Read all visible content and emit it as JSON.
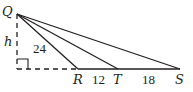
{
  "diagram": {
    "type": "geometry-triangle",
    "points": {
      "Q": {
        "label": "Q"
      },
      "R": {
        "label": "R"
      },
      "T": {
        "label": "T"
      },
      "S": {
        "label": "S"
      }
    },
    "height_label": "h",
    "segment_QR_label": "24",
    "segment_RT_label": "12",
    "segment_TS_label": "18",
    "colors": {
      "stroke": "#231f20",
      "background": "#ffffff"
    }
  }
}
